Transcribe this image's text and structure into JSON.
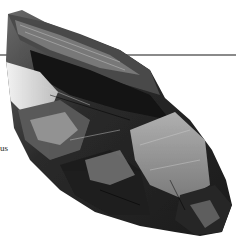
{
  "image": {
    "subject": "metallic mineral crystal photograph",
    "background_color": "#ffffff",
    "rule_color": "#8a8a8a",
    "caption_fragment": "us"
  }
}
